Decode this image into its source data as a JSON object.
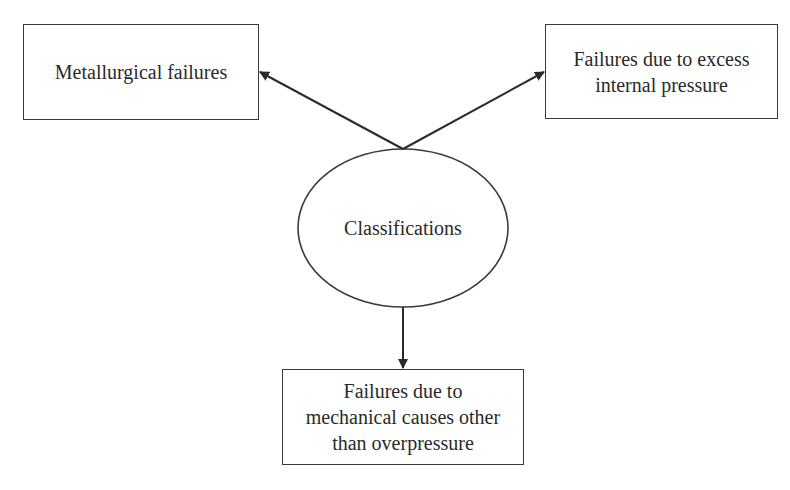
{
  "diagram": {
    "center_node": {
      "label": "Classifications",
      "shape": "ellipse"
    },
    "nodes": [
      {
        "id": "left",
        "lines": [
          "Metallurgical failures"
        ]
      },
      {
        "id": "right",
        "lines": [
          "Failures due to excess",
          "internal pressure"
        ]
      },
      {
        "id": "bottom",
        "lines": [
          "Failures due to",
          "mechanical causes other",
          "than overpressure"
        ]
      }
    ],
    "edges": [
      {
        "from": "center",
        "to": "left"
      },
      {
        "from": "center",
        "to": "right"
      },
      {
        "from": "center",
        "to": "bottom"
      }
    ],
    "colors": {
      "stroke": "#3a3a3a",
      "text": "#2a2a2a",
      "background": "#ffffff"
    }
  }
}
